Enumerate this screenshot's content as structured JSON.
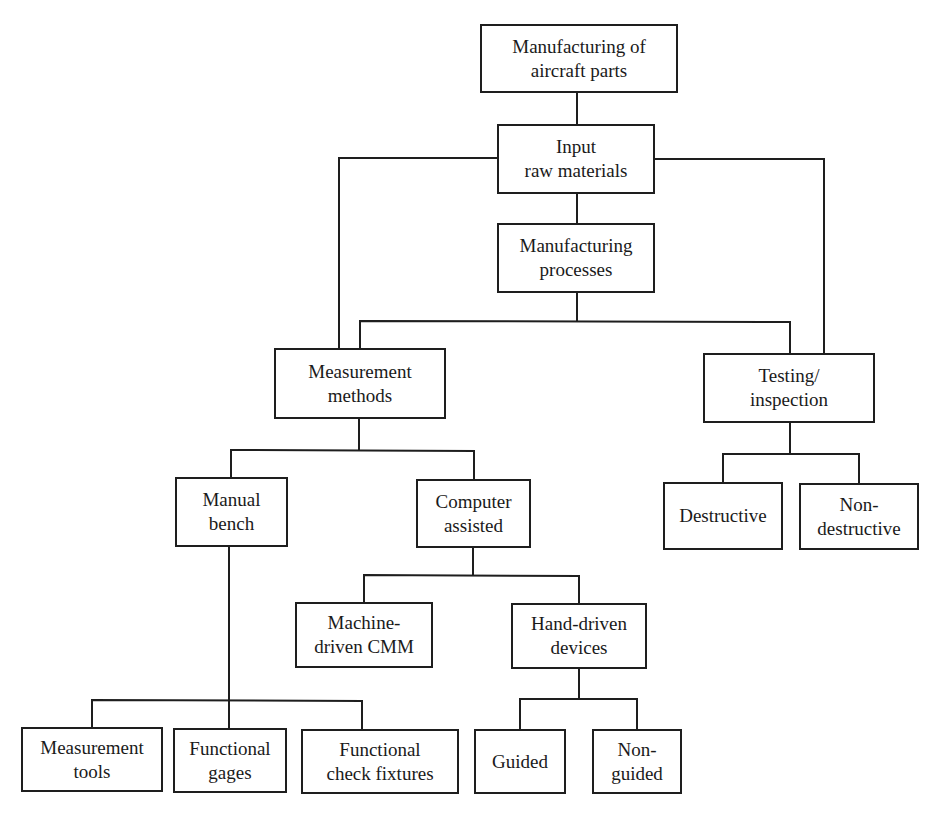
{
  "diagram": {
    "type": "hierarchy",
    "title": "Manufacturing of aircraft parts",
    "line_color": "#1e1e1e",
    "box_border_color": "#1e1e1e",
    "background_color": "#ffffff",
    "nodes": {
      "root": {
        "label": "Manufacturing of\naircraft parts"
      },
      "input": {
        "label": "Input\nraw materials"
      },
      "processes": {
        "label": "Manufacturing\nprocesses"
      },
      "measurement_methods": {
        "label": "Measurement\nmethods"
      },
      "testing": {
        "label": "Testing/\ninspection"
      },
      "manual_bench": {
        "label": "Manual\nbench"
      },
      "computer_assisted": {
        "label": "Computer\nassisted"
      },
      "destructive": {
        "label": "Destructive"
      },
      "non_destructive": {
        "label": "Non-\ndestructive"
      },
      "machine_cmm": {
        "label": "Machine-\ndriven CMM"
      },
      "hand_driven": {
        "label": "Hand-driven\ndevices"
      },
      "measurement_tools": {
        "label": "Measurement\ntools"
      },
      "functional_gages": {
        "label": "Functional\ngages"
      },
      "functional_fixtures": {
        "label": "Functional\ncheck fixtures"
      },
      "guided": {
        "label": "Guided"
      },
      "non_guided": {
        "label": "Non-\nguided"
      }
    },
    "edges": [
      [
        "root",
        "input"
      ],
      [
        "input",
        "processes"
      ],
      [
        "input",
        "measurement_methods"
      ],
      [
        "input",
        "testing"
      ],
      [
        "processes",
        "measurement_methods"
      ],
      [
        "processes",
        "testing"
      ],
      [
        "measurement_methods",
        "manual_bench"
      ],
      [
        "measurement_methods",
        "computer_assisted"
      ],
      [
        "testing",
        "destructive"
      ],
      [
        "testing",
        "non_destructive"
      ],
      [
        "computer_assisted",
        "machine_cmm"
      ],
      [
        "computer_assisted",
        "hand_driven"
      ],
      [
        "manual_bench",
        "measurement_tools"
      ],
      [
        "manual_bench",
        "functional_gages"
      ],
      [
        "manual_bench",
        "functional_fixtures"
      ],
      [
        "hand_driven",
        "guided"
      ],
      [
        "hand_driven",
        "non_guided"
      ]
    ]
  }
}
